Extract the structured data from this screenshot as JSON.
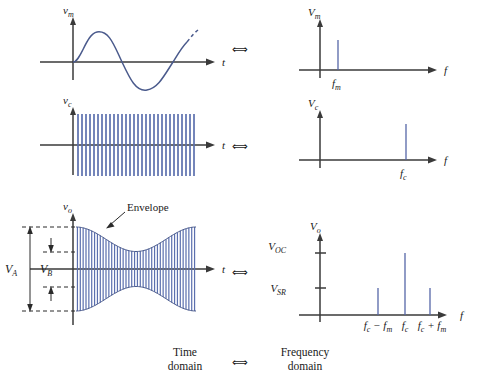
{
  "figure": {
    "title_visible": false,
    "colors": {
      "wave": "#4a5a8c",
      "carrier_fill": "#5b6fae",
      "spike": "#5566a8",
      "axis": "#3a3a3a",
      "text": "#1a1a1a",
      "background": "#ffffff"
    },
    "caption": {
      "left_line1": "Time",
      "left_line2": "domain",
      "equiv_symbol": "⟺",
      "right_line1": "Frequency",
      "right_line2": "domain"
    },
    "rows": [
      {
        "id": "modulating-signal",
        "equiv_symbol": "⟺",
        "time": {
          "y_axis_label": "v",
          "y_axis_sub": "m",
          "x_axis_label": "t",
          "signal_type": "sine",
          "cycles": 1,
          "dashed_tail": true
        },
        "freq": {
          "y_axis_label": "V",
          "y_axis_sub": "m",
          "x_axis_label": "f",
          "spikes": [
            {
              "label": "f",
              "sub": "m",
              "x_frac": 0.17,
              "height_frac": 0.62
            }
          ]
        }
      },
      {
        "id": "carrier-signal",
        "equiv_symbol": "⟺",
        "time": {
          "y_axis_label": "v",
          "y_axis_sub": "c",
          "x_axis_label": "t",
          "signal_type": "high-frequency-sine",
          "cycles": 30,
          "dashed_tail": false
        },
        "freq": {
          "y_axis_label": "V",
          "y_axis_sub": "c",
          "x_axis_label": "f",
          "spikes": [
            {
              "label": "f",
              "sub": "c",
              "x_frac": 0.71,
              "height_frac": 0.78
            }
          ]
        }
      },
      {
        "id": "am-output-signal",
        "equiv_symbol": "⟺",
        "time": {
          "y_axis_label": "v",
          "y_axis_sub": "o",
          "x_axis_label": "t",
          "signal_type": "amplitude-modulated",
          "annotation": "Envelope",
          "amplitude_markers": [
            {
              "label": "V",
              "sub": "A",
              "meaning": "peak-to-peak-maximum"
            },
            {
              "label": "V",
              "sub": "B",
              "meaning": "peak-to-peak-minimum"
            }
          ]
        },
        "freq": {
          "y_axis_label": "V",
          "y_axis_sub": "o",
          "x_axis_label": "f",
          "y_ticks": [
            {
              "label": "V",
              "sub": "OC",
              "height_frac": 0.8
            },
            {
              "label": "V",
              "sub": "SR",
              "height_frac": 0.4
            }
          ],
          "spikes": [
            {
              "label": "f",
              "sub": "c",
              "prefix": "",
              "expr": "f_c − f_m",
              "x_frac": 0.5,
              "height_frac": 0.4
            },
            {
              "label": "f",
              "sub": "c",
              "prefix": "",
              "expr": "f_c",
              "x_frac": 0.66,
              "height_frac": 0.8
            },
            {
              "label": "f",
              "sub": "c",
              "prefix": "",
              "expr": "f_c + f_m",
              "x_frac": 0.8,
              "height_frac": 0.4
            }
          ],
          "x_tick_labels": [
            "f_c − f_m",
            "f_c",
            "f_c + f_m"
          ]
        }
      }
    ]
  }
}
